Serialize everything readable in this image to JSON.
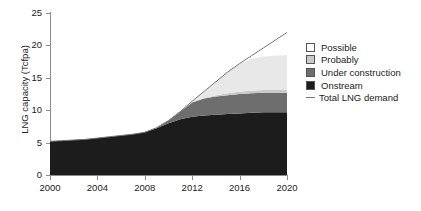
{
  "chart_data": {
    "type": "area",
    "title": "",
    "xlabel": "",
    "ylabel": "LNG capacity (Tcfpa)",
    "xlim": [
      2000,
      2020
    ],
    "ylim": [
      0,
      25
    ],
    "xticks": [
      2000,
      2004,
      2008,
      2012,
      2016,
      2020
    ],
    "yticks": [
      0,
      5,
      10,
      15,
      20,
      25
    ],
    "grid": false,
    "legend_position": "right",
    "stacked": true,
    "x": [
      2000,
      2001,
      2002,
      2003,
      2004,
      2005,
      2006,
      2007,
      2008,
      2009,
      2010,
      2011,
      2012,
      2013,
      2014,
      2015,
      2016,
      2017,
      2018,
      2019,
      2020
    ],
    "series": [
      {
        "name": "Onstream",
        "color": "#1c1c1c",
        "values": [
          5.2,
          5.3,
          5.4,
          5.5,
          5.7,
          5.9,
          6.1,
          6.3,
          6.6,
          7.2,
          8.0,
          8.6,
          9.0,
          9.2,
          9.3,
          9.4,
          9.5,
          9.6,
          9.7,
          9.7,
          9.7
        ]
      },
      {
        "name": "Under construction",
        "color": "#6e6e6e",
        "values": [
          0,
          0,
          0,
          0,
          0,
          0,
          0,
          0,
          0,
          0.1,
          0.4,
          1.2,
          2.2,
          2.6,
          2.8,
          2.9,
          3.0,
          3.0,
          3.0,
          3.0,
          3.0
        ]
      },
      {
        "name": "Probably",
        "color": "#c9c9c9",
        "values": [
          0,
          0,
          0,
          0,
          0,
          0,
          0,
          0,
          0,
          0,
          0,
          0,
          0.05,
          0.1,
          0.2,
          0.3,
          0.35,
          0.4,
          0.4,
          0.4,
          0.4
        ]
      },
      {
        "name": "Possible",
        "color": "#e8e8e8",
        "values": [
          0,
          0,
          0,
          0,
          0,
          0,
          0,
          0,
          0,
          0,
          0,
          0,
          0.2,
          1.0,
          2.2,
          3.4,
          4.3,
          4.9,
          5.2,
          5.3,
          5.4
        ]
      }
    ],
    "line_series": {
      "name": "Total LNG demand",
      "color": "#777777",
      "values": [
        5.2,
        5.3,
        5.4,
        5.5,
        5.7,
        5.9,
        6.1,
        6.3,
        6.6,
        7.3,
        8.4,
        9.8,
        11.4,
        12.9,
        14.4,
        15.9,
        17.2,
        18.4,
        19.6,
        20.8,
        22.0
      ]
    }
  },
  "legend": {
    "items": [
      {
        "label": "Possible",
        "swatch": "#ffffff"
      },
      {
        "label": "Probably",
        "swatch": "#c9c9c9"
      },
      {
        "label": "Under construction",
        "swatch": "#6e6e6e"
      },
      {
        "label": "Onstream",
        "swatch": "#1c1c1c"
      }
    ],
    "line_item": {
      "label": "Total LNG demand",
      "color": "#777777"
    }
  }
}
